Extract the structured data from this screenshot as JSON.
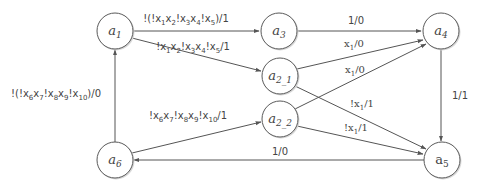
{
  "diagram": {
    "type": "state-machine",
    "nodes": [
      {
        "id": "a1",
        "base": "a",
        "sub": "1",
        "cx": 115,
        "cy": 31,
        "italic": true
      },
      {
        "id": "a3",
        "base": "a",
        "sub": "3",
        "cx": 279,
        "cy": 31,
        "italic": true
      },
      {
        "id": "a4",
        "base": "a",
        "sub": "4",
        "cx": 441,
        "cy": 31,
        "italic": true
      },
      {
        "id": "a2_1",
        "base": "a",
        "sub": "2_1",
        "cx": 280,
        "cy": 76,
        "italic": true
      },
      {
        "id": "a2_2",
        "base": "a",
        "sub": "2_2",
        "cx": 280,
        "cy": 119,
        "italic": true
      },
      {
        "id": "a6",
        "base": "a",
        "sub": "6",
        "cx": 115,
        "cy": 160,
        "italic": true
      },
      {
        "id": "a5",
        "base": "a",
        "sub": "5",
        "cx": 442,
        "cy": 160,
        "italic": false
      }
    ],
    "edges": [
      {
        "from": "a1",
        "to": "a3",
        "label": "!(!x1x2!x3x4!x5)/1"
      },
      {
        "from": "a1",
        "to": "a2_1",
        "label": "!x1x2!x3x4!x5/1"
      },
      {
        "from": "a3",
        "to": "a4",
        "label": "1/0"
      },
      {
        "from": "a2_1",
        "to": "a4",
        "label": "x1/0"
      },
      {
        "from": "a2_2",
        "to": "a4",
        "label": "x1/0"
      },
      {
        "from": "a2_1",
        "to": "a5",
        "label": "!x1/1"
      },
      {
        "from": "a2_2",
        "to": "a5",
        "label": "!x1/1"
      },
      {
        "from": "a4",
        "to": "a5",
        "label": "1/1"
      },
      {
        "from": "a5",
        "to": "a6",
        "label": "1/0"
      },
      {
        "from": "a6",
        "to": "a1",
        "label": "!(!x6x7!x8x9!x10)/0"
      },
      {
        "from": "a6",
        "to": "a2_2",
        "label": "!x6x7!x8x9!x10/1"
      }
    ]
  },
  "labels": {
    "a1_base": "a",
    "a1_sub": "1",
    "a3_base": "a",
    "a3_sub": "3",
    "a4_base": "a",
    "a4_sub": "4",
    "a2_1_base": "a",
    "a2_1_sub": "2_1",
    "a2_2_base": "a",
    "a2_2_sub": "2_2",
    "a6_base": "a",
    "a6_sub": "6",
    "a5_base": "a",
    "a5_sub": "5",
    "e_a1_a3": [
      "!(!x",
      "1",
      "x",
      "2",
      "!x",
      "3",
      "x",
      "4",
      "!x",
      "5",
      ")/1"
    ],
    "e_a1_a21": [
      "!x",
      "1",
      "x",
      "2",
      "!x",
      "3",
      "x",
      "4",
      "!x",
      "5",
      "/1"
    ],
    "e_a3_a4": "1/0",
    "e_a21_a4": [
      "x",
      "1",
      "/0"
    ],
    "e_a22_a4": [
      "x",
      "1",
      "/0"
    ],
    "e_a21_a5": [
      "!x",
      "1",
      "/1"
    ],
    "e_a22_a5": [
      "!x",
      "1",
      "/1"
    ],
    "e_a4_a5": "1/1",
    "e_a5_a6": "1/0",
    "e_a6_a1": [
      "!(!x",
      "6",
      "x",
      "7",
      "!x",
      "8",
      "x",
      "9",
      "!x",
      "10",
      ")/0"
    ],
    "e_a6_a22": [
      "!x",
      "6",
      "x",
      "7",
      "!x",
      "8",
      "x",
      "9",
      "!x",
      "10",
      "/1"
    ]
  }
}
